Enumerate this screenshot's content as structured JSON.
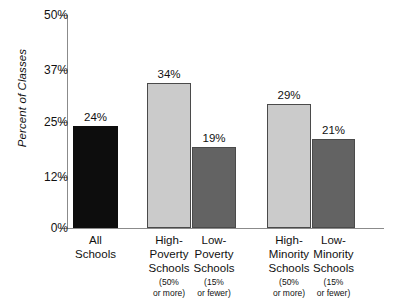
{
  "chart_data": {
    "type": "bar",
    "title": "",
    "subtitle": "",
    "xlabel": "",
    "ylabel": "Percent of Classes",
    "ylim": [
      0,
      50
    ],
    "grid": false,
    "legend": "none",
    "y_ticks": [
      "0%",
      "12%",
      "25%",
      "37%",
      "50%"
    ],
    "y_tick_values": [
      0,
      12,
      25,
      37,
      50
    ],
    "categories": [
      "All\nSchools",
      "High-\nPoverty\nSchools",
      "Low-\nPoverty\nSchools",
      "High-\nMinority\nSchools",
      "Low-\nMinority\nSchools"
    ],
    "category_sublabels": [
      "",
      "(50%\nor more)",
      "(15%\nor fewer)",
      "(50%\nor more)",
      "(15%\nor fewer)"
    ],
    "values": [
      24,
      34,
      19,
      29,
      21
    ],
    "value_labels": [
      "24%",
      "34%",
      "19%",
      "29%",
      "21%"
    ],
    "bar_styles": [
      "black",
      "light",
      "dark",
      "light",
      "dark"
    ],
    "colors": {
      "black": "#0d0d0d",
      "light": "#cbcbcb",
      "dark": "#636363",
      "border": "#4a4a4a",
      "axis": "#8b8b8b",
      "text": "#111111",
      "background": "#ffffff"
    }
  }
}
